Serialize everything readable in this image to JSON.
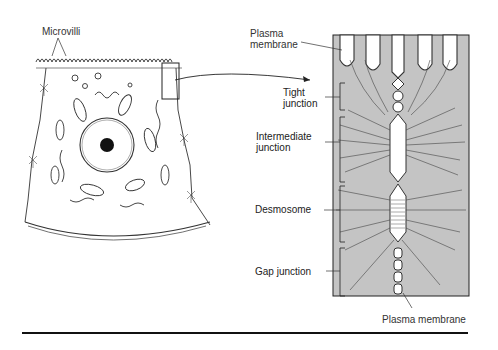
{
  "diagram": {
    "cell_view": {
      "labels": {
        "microvilli": "Microvilli"
      }
    },
    "enlarged_view": {
      "background_color": "#c4c4c4",
      "labels": {
        "plasma_membrane_top": "Plasma\nmembrane",
        "tight_junction": "Tight\njunction",
        "intermediate_junction": "Intermediate\njunction",
        "desmosome": "Desmosome",
        "gap_junction": "Gap junction",
        "plasma_membrane_bottom": "Plasma membrane"
      }
    }
  }
}
